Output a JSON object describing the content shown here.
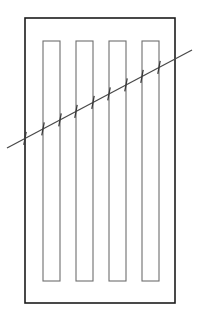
{
  "figure": {
    "background_color": "#ffffff",
    "canvas": {
      "width": 199,
      "height": 321
    },
    "frame": {
      "label": "outer panel frame",
      "x": 25,
      "y": 18,
      "width": 150,
      "height": 285,
      "stroke_color": "#1c1c1c",
      "stroke_width": 1.6
    },
    "strips": {
      "label": "vertical slat openings",
      "count": 4,
      "y": 41,
      "height": 240,
      "width": 17,
      "stroke_color": "#6e6e6e",
      "stroke_width": 1.1,
      "items": [
        {
          "label": "slat-1",
          "x": 43
        },
        {
          "label": "slat-2",
          "x": 76
        },
        {
          "label": "slat-3",
          "x": 109
        },
        {
          "label": "slat-4",
          "x": 142
        }
      ]
    },
    "diagonal": {
      "label": "diagonal section line",
      "x1": 7,
      "y1": 148,
      "x2": 192,
      "y2": 50,
      "stroke_color": "#4a4a4a",
      "stroke_width": 1.3
    },
    "ticks": {
      "label": "intersection tick marks",
      "count": 9,
      "length": 13,
      "stroke_color": "#3a3a3a",
      "stroke_width": 1.3,
      "positions_x": [
        25,
        43,
        60,
        76,
        93,
        109,
        126,
        142,
        159,
        175
      ]
    }
  }
}
